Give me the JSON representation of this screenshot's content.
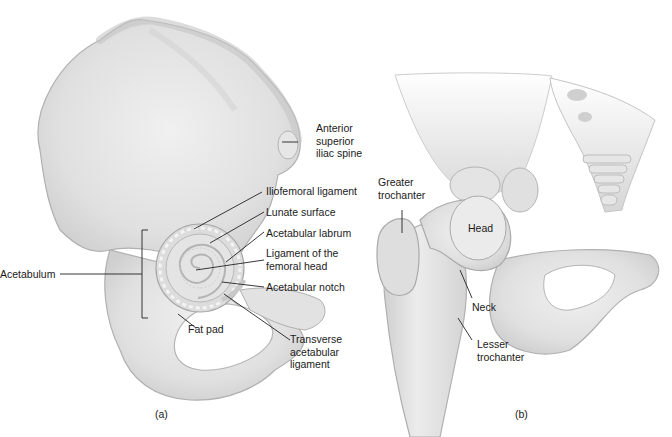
{
  "figure": {
    "panel_a": {
      "caption": "(a)",
      "labels": {
        "asis_1": "Anterior",
        "asis_2": "superior",
        "asis_3": "iliac spine",
        "iliofemoral": "Iliofemoral ligament",
        "lunate": "Lunate surface",
        "labrum": "Acetabular labrum",
        "lig_femoral_1": "Ligament of the",
        "lig_femoral_2": "femoral head",
        "notch": "Acetabular notch",
        "transverse_1": "Transverse",
        "transverse_2": "acetabular",
        "transverse_3": "ligament",
        "fat_pad": "Fat pad",
        "acetabulum": "Acetabulum"
      }
    },
    "panel_b": {
      "caption": "(b)",
      "labels": {
        "greater_1": "Greater",
        "greater_2": "trochanter",
        "head": "Head",
        "neck": "Neck",
        "lesser_1": "Lesser",
        "lesser_2": "trochanter"
      }
    },
    "colors": {
      "bone_fill": "#e4e4e4",
      "bone_shadow": "#c8c8c8",
      "bone_outline": "#a8a8a8",
      "leader_line": "#222222",
      "background": "#ffffff"
    }
  }
}
